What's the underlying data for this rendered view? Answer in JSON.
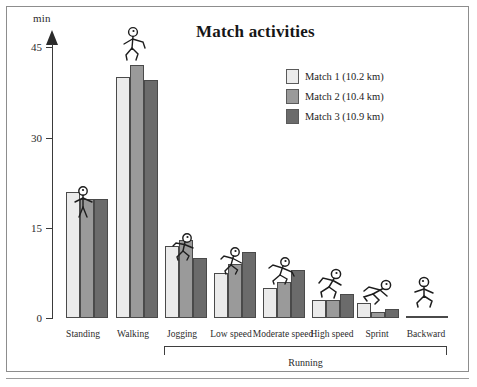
{
  "chart_data": {
    "type": "bar",
    "title": "Match activities",
    "xlabel": "",
    "ylabel": "min",
    "ylim": [
      0,
      45
    ],
    "yticks": [
      0,
      15,
      30,
      45
    ],
    "grid": false,
    "legend_position": "top-right",
    "categories": [
      "Standing",
      "Walking",
      "Jogging",
      "Low speed",
      "Moderate speed",
      "High speed",
      "Sprint",
      "Backward"
    ],
    "group_label": "Running",
    "group_label_spans": [
      "Jogging",
      "Low speed",
      "Moderate speed",
      "High speed",
      "Sprint",
      "Backward"
    ],
    "series": [
      {
        "name": "Match 1 (10.2 km)",
        "color": "#ebebeb",
        "values": [
          21,
          40,
          12,
          7.5,
          5,
          3,
          2.5,
          0.2
        ]
      },
      {
        "name": "Match 2 (10.4 km)",
        "color": "#9a9a9a",
        "values": [
          19.8,
          42,
          13,
          9,
          6,
          3,
          1,
          0.2
        ]
      },
      {
        "name": "Match 3 (10.9 km)",
        "color": "#6b6b6b",
        "values": [
          19.8,
          39.5,
          10,
          11,
          8,
          4,
          1.5,
          0.2
        ]
      }
    ]
  },
  "axis": {
    "unit_label": "min",
    "tick_labels": [
      "45",
      "30",
      "15",
      "0"
    ]
  },
  "legend": {
    "items": [
      {
        "label": "Match 1 (10.2 km)",
        "color": "#ebebeb"
      },
      {
        "label": "Match 2 (10.4 km)",
        "color": "#9a9a9a"
      },
      {
        "label": "Match 3 (10.9 km)",
        "color": "#6b6b6b"
      }
    ]
  },
  "icons": {
    "standing": "standing-stick-figure-icon",
    "walking": "walking-stick-figure-icon",
    "jogging": "jogging-stick-figure-icon",
    "low_speed": "low-speed-running-stick-figure-icon",
    "moderate_speed": "moderate-speed-running-stick-figure-icon",
    "high_speed": "high-speed-running-stick-figure-icon",
    "sprint": "sprinting-stick-figure-icon",
    "backward": "backward-running-stick-figure-icon"
  }
}
